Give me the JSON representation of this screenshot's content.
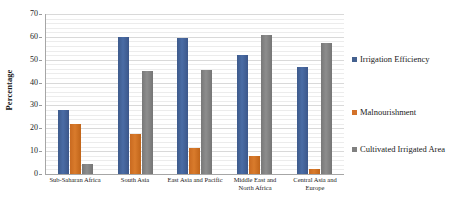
{
  "chart_data": {
    "type": "bar",
    "title": "",
    "xlabel": "",
    "ylabel": "Percentage",
    "ylim": [
      0,
      70
    ],
    "ytick_step": 10,
    "yticks": [
      0,
      10,
      20,
      30,
      40,
      50,
      60,
      70
    ],
    "grid": true,
    "legend_position": "right",
    "categories": [
      "Sub-Saharan Africa",
      "South Asia",
      "East Asia and Pacific",
      "Middle East and North Africa",
      "Central Asia and Europe"
    ],
    "series": [
      {
        "name": "Irrigation Efficiency",
        "color": "#44618f",
        "values": [
          28,
          60,
          59.5,
          52,
          47
        ]
      },
      {
        "name": "Malnourishment",
        "color": "#d3722a",
        "values": [
          22,
          17.5,
          11.5,
          8,
          2
        ]
      },
      {
        "name": "Cultivated Irrigated Area",
        "color": "#808080",
        "values": [
          4.5,
          45,
          45.5,
          61,
          57.5
        ]
      }
    ]
  },
  "axis": {
    "y_title": "Percentage"
  },
  "legend": {
    "items": [
      {
        "label": "Irrigation Efficiency",
        "color": "#44618f"
      },
      {
        "label": "Malnourishment",
        "color": "#d3722a"
      },
      {
        "label": "Cultivated Irrigated Area",
        "color": "#808080"
      }
    ]
  }
}
